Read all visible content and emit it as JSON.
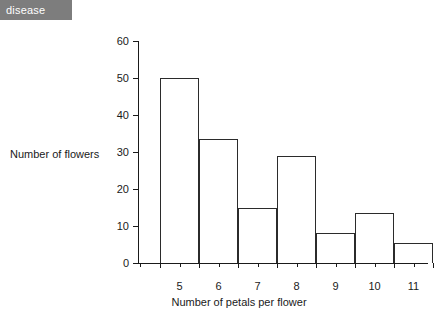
{
  "tag": {
    "label": "disease"
  },
  "chart_data": {
    "type": "bar",
    "title": "",
    "subtitle": "",
    "xlabel": "Number of petals per flower",
    "ylabel": "Number of flowers",
    "categories": [
      "5",
      "6",
      "7",
      "8",
      "9",
      "10",
      "11"
    ],
    "values": [
      50,
      33.5,
      15,
      28.8,
      8,
      13.5,
      5.3
    ],
    "ylim": [
      0,
      60
    ],
    "y_ticks": [
      0,
      10,
      20,
      30,
      40,
      50,
      60
    ],
    "y_tick_labels": [
      "0",
      "10",
      "20",
      "30",
      "40",
      "50",
      "60"
    ],
    "grid": false,
    "legend": null,
    "bar_fill_color": "#ffffff",
    "bar_edge_color": "#2b2b2b",
    "axis_color": "#1a1a1a",
    "background_color": "#ffffff"
  }
}
